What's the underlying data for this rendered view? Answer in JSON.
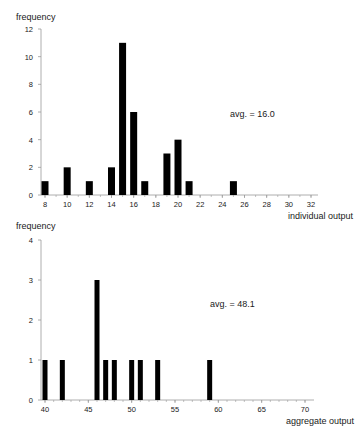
{
  "chart_data": [
    {
      "type": "bar",
      "title": "",
      "xlabel": "individual output",
      "ylabel": "frequency",
      "annotation": "avg. = 16.0",
      "xlim": [
        8,
        32
      ],
      "ylim": [
        0,
        12
      ],
      "x_ticks": [
        8,
        10,
        12,
        14,
        16,
        18,
        20,
        22,
        24,
        26,
        28,
        30,
        32
      ],
      "y_ticks": [
        0,
        2,
        4,
        6,
        8,
        10,
        12
      ],
      "grid": false,
      "categories": [
        8,
        10,
        12,
        14,
        15,
        16,
        17,
        19,
        20,
        21,
        25
      ],
      "values": [
        1,
        2,
        1,
        2,
        11,
        6,
        1,
        3,
        4,
        1,
        1
      ]
    },
    {
      "type": "bar",
      "title": "",
      "xlabel": "aggregate output",
      "ylabel": "frequency",
      "annotation": "avg. = 48.1",
      "xlim": [
        40,
        70
      ],
      "ylim": [
        0,
        4
      ],
      "x_ticks": [
        40,
        45,
        50,
        55,
        60,
        65,
        70
      ],
      "y_ticks": [
        0,
        1,
        2,
        3,
        4
      ],
      "grid": false,
      "categories": [
        40,
        42,
        46,
        47,
        48,
        50,
        51,
        53,
        59
      ],
      "values": [
        1,
        1,
        3,
        1,
        1,
        1,
        1,
        1,
        1
      ]
    }
  ],
  "colors": {
    "bar": "#000000",
    "axis": "#9a9a9a",
    "text": "#1a1a1a"
  }
}
